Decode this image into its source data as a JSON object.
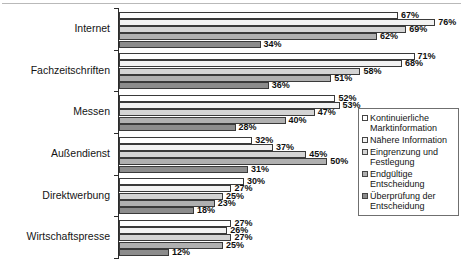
{
  "chart_data": {
    "type": "bar",
    "orientation": "horizontal",
    "title": "",
    "subtitle": "",
    "xlabel": "",
    "ylabel": "",
    "xlim": [
      0,
      80
    ],
    "grid": false,
    "legend_position": "right-middle",
    "value_suffix": "%",
    "categories": [
      "Internet",
      "Fachzeitschriften",
      "Messen",
      "Außendienst",
      "Direktwerbung",
      "Wirtschaftspresse"
    ],
    "series": [
      {
        "name": "Kontinuierliche Marktinformation",
        "color": "#ffffff",
        "values": [
          67,
          71,
          52,
          32,
          30,
          27
        ]
      },
      {
        "name": "Nähere Information",
        "color": "#f2f2f2",
        "values": [
          76,
          68,
          53,
          37,
          27,
          26
        ]
      },
      {
        "name": "Eingrenzung und Festlegung",
        "color": "#d4d4d4",
        "values": [
          69,
          58,
          47,
          45,
          25,
          27
        ]
      },
      {
        "name": "Endgültige Entscheidung",
        "color": "#b0b0b0",
        "values": [
          62,
          51,
          40,
          50,
          23,
          25
        ]
      },
      {
        "name": "Überprüfung der Entscheidung",
        "color": "#8c8c8c",
        "values": [
          34,
          36,
          28,
          31,
          18,
          12
        ]
      }
    ],
    "data_labels": [
      [
        "67%",
        "76%",
        "69%",
        "62%",
        "34%"
      ],
      [
        "71%",
        "68%",
        "58%",
        "51%",
        "36%"
      ],
      [
        "52%",
        "53%",
        "47%",
        "40%",
        "28%"
      ],
      [
        "32%",
        "37%",
        "45%",
        "50%",
        "31%"
      ],
      [
        "30%",
        "27%",
        "25%",
        "23%",
        "18%"
      ],
      [
        "27%",
        "26%",
        "27%",
        "25%",
        "12%"
      ]
    ]
  },
  "legend": {
    "items": [
      "Kontinuierliche Marktinformation",
      "Nähere Information",
      "Eingrenzung und Festlegung",
      "Endgültige Entscheidung",
      "Überprüfung der Entscheidung"
    ]
  }
}
